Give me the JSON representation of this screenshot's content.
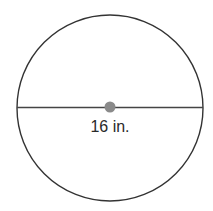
{
  "diagram": {
    "shape": "circle",
    "segment": "diameter",
    "diameter_label": "16 in.",
    "colors": {
      "outline": "#333333",
      "center_dot": "#8a8a8a",
      "text": "#2a2a2a",
      "background": "#ffffff"
    }
  }
}
